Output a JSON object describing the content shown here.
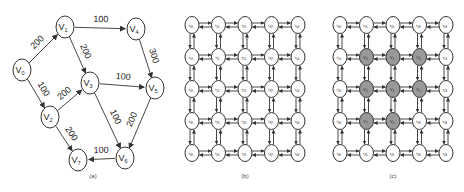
{
  "figure_a": {
    "caption": "(a)",
    "nodes": [
      {
        "id": "V0",
        "x": 22,
        "y": 70
      },
      {
        "id": "V1",
        "x": 65,
        "y": 27
      },
      {
        "id": "V2",
        "x": 50,
        "y": 117
      },
      {
        "id": "V3",
        "x": 90,
        "y": 83
      },
      {
        "id": "V4",
        "x": 136,
        "y": 29
      },
      {
        "id": "V5",
        "x": 155,
        "y": 88
      },
      {
        "id": "V6",
        "x": 125,
        "y": 158
      },
      {
        "id": "V7",
        "x": 78,
        "y": 160
      }
    ],
    "edges": [
      {
        "from": "V0",
        "to": "V1",
        "weight": "200"
      },
      {
        "from": "V0",
        "to": "V2",
        "weight": "100"
      },
      {
        "from": "V1",
        "to": "V4",
        "weight": "100"
      },
      {
        "from": "V1",
        "to": "V3",
        "weight": "200"
      },
      {
        "from": "V2",
        "to": "V3",
        "weight": "200"
      },
      {
        "from": "V2",
        "to": "V7",
        "weight": "200"
      },
      {
        "from": "V3",
        "to": "V5",
        "weight": "100"
      },
      {
        "from": "V3",
        "to": "V6",
        "weight": "100"
      },
      {
        "from": "V4",
        "to": "V5",
        "weight": "300"
      },
      {
        "from": "V5",
        "to": "V6",
        "weight": "200"
      },
      {
        "from": "V6",
        "to": "V7",
        "weight": "100"
      }
    ]
  },
  "figure_b": {
    "caption": "(b)",
    "rows": 5,
    "cols": 5,
    "origin_x": 192,
    "origin_y": 25,
    "dx": 26.5,
    "dy": 32,
    "node_prefix": "t"
  },
  "figure_c": {
    "caption": "(c)",
    "rows": 5,
    "cols": 5,
    "origin_x": 340,
    "origin_y": 25,
    "dx": 26.5,
    "dy": 32,
    "node_prefix": "t",
    "mapped": [
      {
        "r": 1,
        "c": 1,
        "label": "V0"
      },
      {
        "r": 1,
        "c": 2,
        "label": "V1"
      },
      {
        "r": 1,
        "c": 3,
        "label": "V4"
      },
      {
        "r": 2,
        "c": 1,
        "label": "V2"
      },
      {
        "r": 2,
        "c": 2,
        "label": "V3"
      },
      {
        "r": 2,
        "c": 3,
        "label": "V5"
      },
      {
        "r": 3,
        "c": 1,
        "label": "V7"
      },
      {
        "r": 3,
        "c": 2,
        "label": "V6"
      }
    ],
    "mapped_color": "#999999"
  }
}
